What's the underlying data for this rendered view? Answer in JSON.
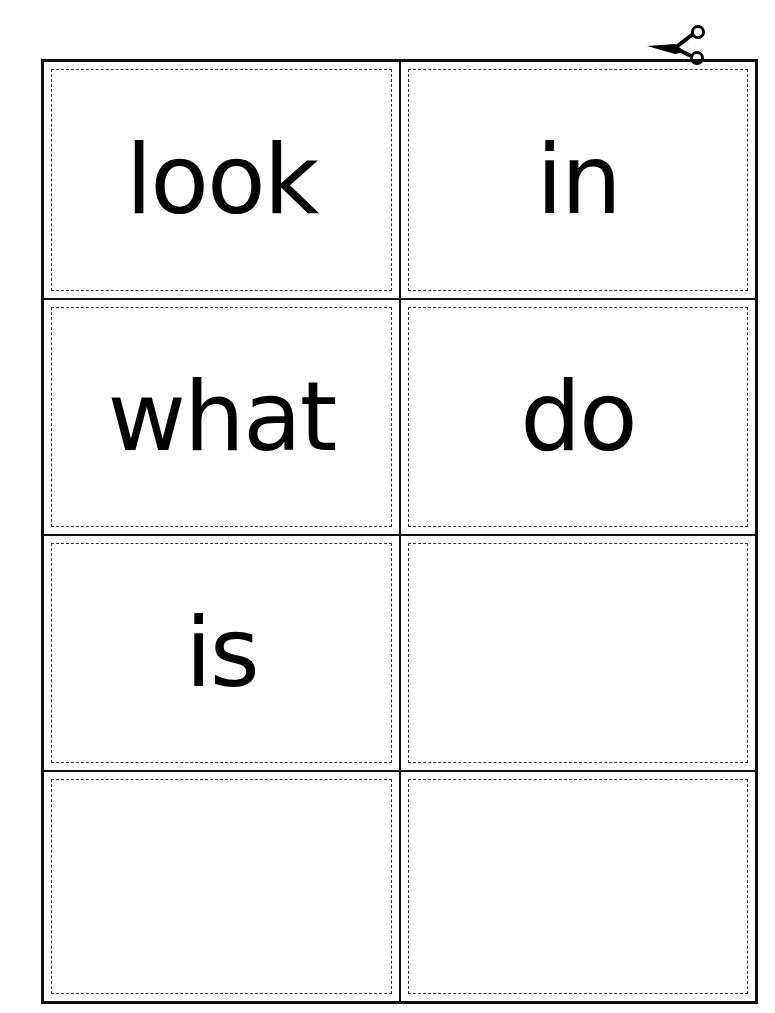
{
  "sheet": {
    "columns": 2,
    "rows": 4,
    "cards": [
      {
        "word": "look"
      },
      {
        "word": "in"
      },
      {
        "word": "what"
      },
      {
        "word": "do"
      },
      {
        "word": "is"
      },
      {
        "word": ""
      },
      {
        "word": ""
      },
      {
        "word": ""
      }
    ]
  },
  "icons": {
    "cut_marker": "scissors-icon"
  },
  "colors": {
    "line": "#111111",
    "background": "#ffffff",
    "text": "#000000"
  }
}
